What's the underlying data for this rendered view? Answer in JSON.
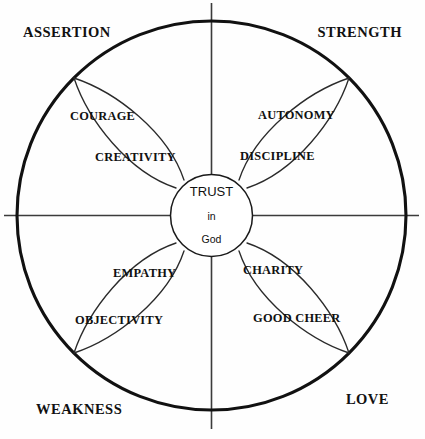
{
  "diagram": {
    "center": {
      "line1": "TRUST",
      "line2": "in",
      "line3": "God"
    },
    "axis_labels": [
      {
        "key": "upper_left",
        "text": "ASSERTION"
      },
      {
        "key": "upper_right",
        "text": "STRENGTH"
      },
      {
        "key": "lower_left",
        "text": "WEAKNESS"
      },
      {
        "key": "lower_right",
        "text": "LOVE"
      }
    ],
    "petals": [
      {
        "key": "upper_left",
        "quadrant": "ASSERTION",
        "outer_label": "COURAGE",
        "inner_label": "CREATIVITY"
      },
      {
        "key": "upper_right",
        "quadrant": "STRENGTH",
        "outer_label": "AUTONOMY",
        "inner_label": "DISCIPLINE"
      },
      {
        "key": "lower_left",
        "quadrant": "WEAKNESS",
        "outer_label": "OBJECTIVITY",
        "inner_label": "EMPATHY"
      },
      {
        "key": "lower_right",
        "quadrant": "LOVE",
        "outer_label": "GOOD CHEER",
        "inner_label": "CHARITY"
      }
    ],
    "colors": {
      "stroke_outer": "#111111",
      "stroke_inner": "#1a1a1a",
      "stroke_petal": "#2a2a2a",
      "stroke_axis": "#3b3b3b",
      "background": "#ffffff",
      "text": "#111111"
    }
  }
}
